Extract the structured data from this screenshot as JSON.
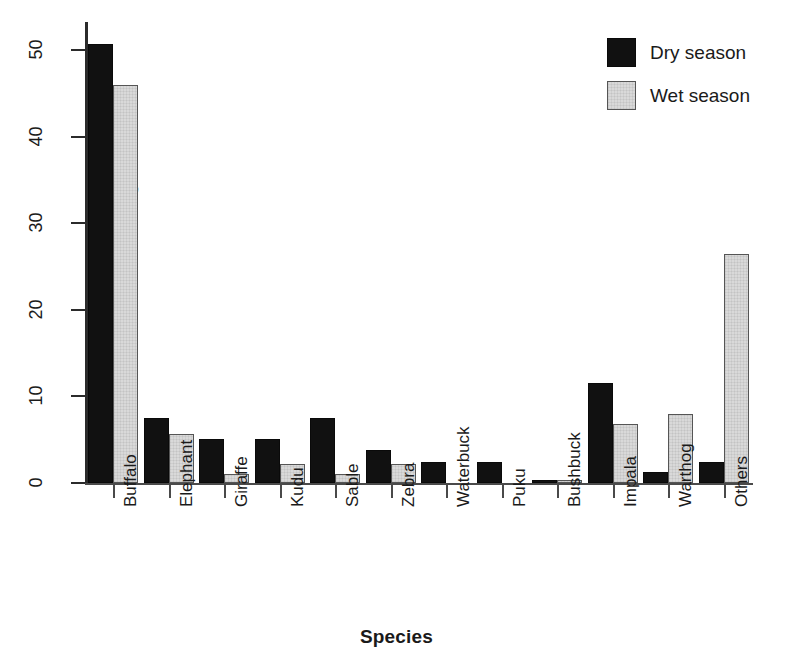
{
  "chart_data": {
    "type": "bar",
    "title": "",
    "xlabel": "Species",
    "ylabel": "Percentage of kills",
    "ylim": [
      0,
      53
    ],
    "yticks": [
      0,
      10,
      20,
      30,
      40,
      50
    ],
    "ytick_labels": [
      "0",
      "10",
      "20",
      "30",
      "40",
      "50"
    ],
    "grid": false,
    "legend_position": "top-right",
    "categories": [
      "Buffalo",
      "Elephant",
      "Giraffe",
      "Kudu",
      "Sable",
      "Zebra",
      "Waterbuck",
      "Puku",
      "Bushbuck",
      "Impala",
      "Warthog",
      "Others"
    ],
    "series": [
      {
        "name": "Dry season",
        "color": "#111111",
        "values": [
          50.7,
          7.5,
          5.1,
          5.1,
          7.5,
          3.8,
          2.4,
          2.4,
          0.4,
          11.6,
          1.3,
          2.4
        ]
      },
      {
        "name": "Wet season",
        "color": "#d9d9d9",
        "values": [
          46.0,
          5.7,
          1.0,
          2.2,
          1.0,
          2.2,
          0.0,
          0.0,
          0.4,
          6.8,
          8.0,
          26.5
        ]
      }
    ]
  },
  "legend": {
    "entries": [
      {
        "label": "Dry season",
        "swatch": "black-square-swatch"
      },
      {
        "label": "Wet season",
        "swatch": "light-gray-square-swatch"
      }
    ]
  }
}
